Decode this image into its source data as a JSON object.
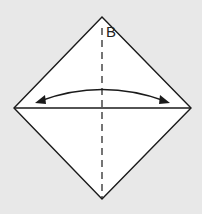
{
  "diagram": {
    "type": "origami-fold-step",
    "label": "B",
    "colors": {
      "background": "#e8e8e8",
      "paper": "#ffffff",
      "line": "#1a1a1a"
    },
    "shape": {
      "kind": "diamond",
      "top": [
        102,
        17
      ],
      "left": [
        14,
        108
      ],
      "right": [
        191,
        108
      ],
      "bottom": [
        102,
        199
      ]
    },
    "lines": [
      {
        "name": "horizontal-crease",
        "style": "solid"
      },
      {
        "name": "vertical-fold-line",
        "style": "dashed"
      }
    ],
    "arrow": {
      "kind": "double-headed-curved",
      "meaning": "fold-and-unfold"
    }
  }
}
